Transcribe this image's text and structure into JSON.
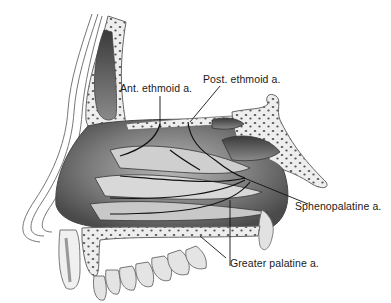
{
  "diagram": {
    "labels": [
      {
        "id": "ant-ethmoid",
        "text": "Ant. ethmoid a."
      },
      {
        "id": "post-ethmoid",
        "text": "Post. ethmoid a."
      },
      {
        "id": "sphenopalatine",
        "text": "Sphenopalatine a."
      },
      {
        "id": "greater-palatine",
        "text": "Greater palatine a."
      }
    ]
  }
}
